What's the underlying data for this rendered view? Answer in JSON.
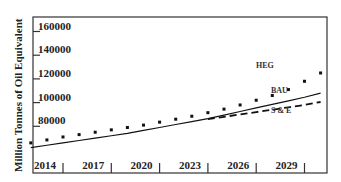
{
  "chart_data": {
    "type": "line",
    "title": "",
    "xlabel": "",
    "ylabel": "Million Tonnes of Oil Equivalent",
    "x_ticks": [
      "2014",
      "2017",
      "2020",
      "2023",
      "2026",
      "2029"
    ],
    "y_ticks": [
      "80000",
      "100000",
      "120000",
      "140000",
      "160000"
    ],
    "xlim": [
      2012,
      2030.5
    ],
    "ylim": [
      55000,
      172000
    ],
    "grid": false,
    "legend": "inline labels",
    "x": [
      2012,
      2013,
      2014,
      2015,
      2016,
      2017,
      2018,
      2019,
      2020,
      2021,
      2022,
      2023,
      2024,
      2025,
      2026,
      2027,
      2028,
      2029,
      2030
    ],
    "series": [
      {
        "name": "HEG",
        "style": "dotted",
        "values": [
          66000,
          68500,
          71000,
          73000,
          75000,
          77000,
          79000,
          81000,
          83500,
          86000,
          88500,
          91500,
          94500,
          98000,
          102000,
          106000,
          111000,
          118000,
          125000
        ]
      },
      {
        "name": "BAU",
        "style": "solid",
        "values": [
          62000,
          64000,
          66000,
          68000,
          70000,
          72000,
          74000,
          76500,
          79000,
          81500,
          84000,
          86500,
          89500,
          92500,
          95500,
          98500,
          101500,
          104500,
          108000
        ]
      },
      {
        "name": "S & E",
        "style": "dashed",
        "values": [
          null,
          null,
          null,
          null,
          null,
          null,
          null,
          null,
          null,
          null,
          null,
          86000,
          88000,
          90000,
          92000,
          94000,
          96000,
          98000,
          100500
        ]
      }
    ]
  },
  "labels": {
    "ylabel": "Million Tonnes of Oil Equivalent",
    "heg": "HEG",
    "bau": "BAU",
    "se": "S & E"
  }
}
